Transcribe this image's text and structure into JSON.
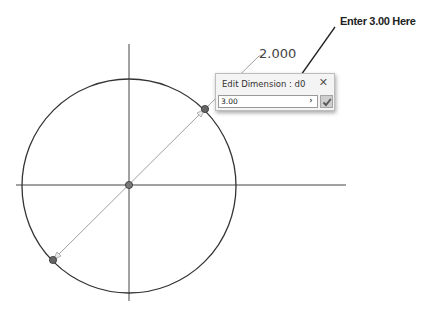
{
  "sketch": {
    "dimension_value": "2.000",
    "circle": {
      "cx": 129,
      "cy": 186,
      "r": 107
    },
    "colors": {
      "geometry": "#333333",
      "dimension_line": "#9a9a9a",
      "point": "#555555"
    }
  },
  "annotation": {
    "text": "Enter 3.00 Here"
  },
  "dialog": {
    "title": "Edit Dimension : d0",
    "input_value": "3.00",
    "close_icon": "close-icon",
    "expand_icon": "chevron-right-icon",
    "accept_icon": "checkmark-icon"
  }
}
